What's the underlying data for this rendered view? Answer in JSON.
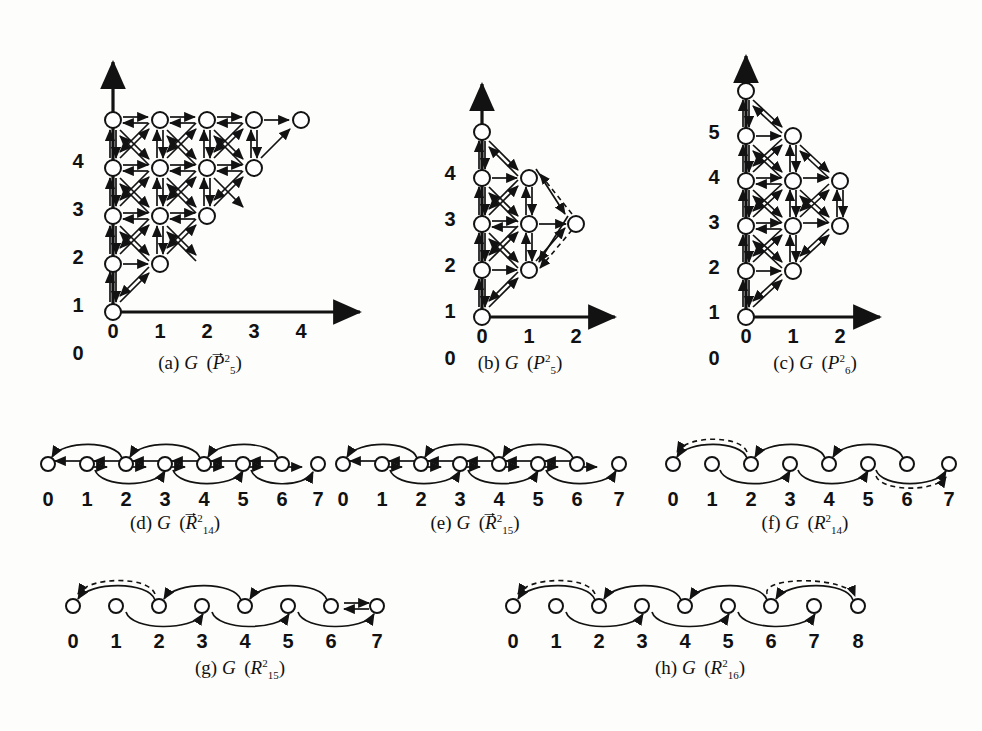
{
  "figure": {
    "background": "#fdfdfb",
    "ink": "#121212",
    "dashed_color": "#121212",
    "node_fill": "#ffffff"
  },
  "panels": [
    {
      "id": "a",
      "caption_prefix": "(a)",
      "caption_script": "G",
      "operand_letter": "P",
      "operand_vector": true,
      "operand_sup": "2",
      "operand_sub": "5",
      "type": "lattice",
      "x_ticks": [
        "0",
        "1",
        "2",
        "3",
        "4"
      ],
      "y_ticks": [
        "0",
        "1",
        "2",
        "3",
        "4"
      ],
      "nodes": [
        [
          0,
          0
        ],
        [
          0,
          1
        ],
        [
          1,
          1
        ],
        [
          0,
          2
        ],
        [
          1,
          2
        ],
        [
          2,
          2
        ],
        [
          0,
          3
        ],
        [
          1,
          3
        ],
        [
          2,
          3
        ],
        [
          3,
          3
        ],
        [
          0,
          4
        ],
        [
          1,
          4
        ],
        [
          2,
          4
        ],
        [
          3,
          4
        ],
        [
          4,
          4
        ]
      ],
      "has_axes": true
    },
    {
      "id": "b",
      "caption_prefix": "(b)",
      "caption_script": "G",
      "operand_letter": "P",
      "operand_vector": false,
      "operand_sup": "2",
      "operand_sub": "5",
      "type": "lattice",
      "x_ticks": [
        "0",
        "1",
        "2"
      ],
      "y_ticks": [
        "0",
        "1",
        "2",
        "3",
        "4"
      ],
      "nodes": [
        [
          0,
          0
        ],
        [
          0,
          1
        ],
        [
          1,
          1
        ],
        [
          0,
          2
        ],
        [
          1,
          2
        ],
        [
          2,
          2
        ],
        [
          0,
          3
        ],
        [
          1,
          3
        ],
        [
          0,
          4
        ]
      ],
      "has_axes": true
    },
    {
      "id": "c",
      "caption_prefix": "(c)",
      "caption_script": "G",
      "operand_letter": "P",
      "operand_vector": false,
      "operand_sup": "2",
      "operand_sub": "6",
      "type": "lattice",
      "x_ticks": [
        "0",
        "1",
        "2"
      ],
      "y_ticks": [
        "0",
        "1",
        "2",
        "3",
        "4",
        "5"
      ],
      "nodes": [
        [
          0,
          0
        ],
        [
          0,
          1
        ],
        [
          1,
          1
        ],
        [
          0,
          2
        ],
        [
          1,
          2
        ],
        [
          2,
          2
        ],
        [
          0,
          3
        ],
        [
          1,
          3
        ],
        [
          2,
          3
        ],
        [
          0,
          4
        ],
        [
          1,
          4
        ],
        [
          0,
          5
        ]
      ],
      "has_axes": true
    },
    {
      "id": "d",
      "caption_prefix": "(d)",
      "caption_script": "G",
      "operand_letter": "R",
      "operand_vector": true,
      "operand_sup": "2",
      "operand_sub": "14",
      "type": "path",
      "labels": [
        "0",
        "1",
        "2",
        "3",
        "4",
        "5",
        "6",
        "7"
      ],
      "has_spine": true,
      "dashed_arcs": []
    },
    {
      "id": "e",
      "caption_prefix": "(e)",
      "caption_script": "G",
      "operand_letter": "R",
      "operand_vector": true,
      "operand_sup": "2",
      "operand_sub": "15",
      "type": "path",
      "labels": [
        "0",
        "1",
        "2",
        "3",
        "4",
        "5",
        "6",
        "7"
      ],
      "has_spine": true,
      "dashed_arcs": []
    },
    {
      "id": "f",
      "caption_prefix": "(f)",
      "caption_script": "G",
      "operand_letter": "R",
      "operand_vector": false,
      "operand_sup": "2",
      "operand_sub": "14",
      "type": "path",
      "labels": [
        "0",
        "1",
        "2",
        "3",
        "4",
        "5",
        "6",
        "7"
      ],
      "has_spine": false,
      "dashed_arcs": [
        "0-2",
        "5-7"
      ]
    },
    {
      "id": "g",
      "caption_prefix": "(g)",
      "caption_script": "G",
      "operand_letter": "R",
      "operand_vector": false,
      "operand_sup": "2",
      "operand_sub": "15",
      "type": "path",
      "labels": [
        "0",
        "1",
        "2",
        "3",
        "4",
        "5",
        "6",
        "7"
      ],
      "has_spine": false,
      "dashed_arcs": [
        "0-2"
      ]
    },
    {
      "id": "h",
      "caption_prefix": "(h)",
      "caption_script": "G",
      "operand_letter": "R",
      "operand_vector": false,
      "operand_sup": "2",
      "operand_sub": "16",
      "type": "path",
      "labels": [
        "0",
        "1",
        "2",
        "3",
        "4",
        "5",
        "6",
        "7",
        "8"
      ],
      "has_spine": false,
      "dashed_arcs": [
        "0-2",
        "6-8"
      ]
    }
  ]
}
